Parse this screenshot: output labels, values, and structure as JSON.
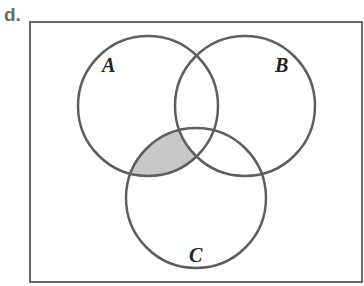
{
  "part_label": "d.",
  "diagram": {
    "type": "venn",
    "universe": {
      "x": 30,
      "y": 22,
      "width": 332,
      "height": 260
    },
    "sets": [
      {
        "id": "A",
        "label": "A",
        "cx": 148,
        "cy": 106,
        "r": 70,
        "label_x": 102,
        "label_y": 72
      },
      {
        "id": "B",
        "label": "B",
        "cx": 245,
        "cy": 106,
        "r": 70,
        "label_x": 275,
        "label_y": 72
      },
      {
        "id": "C",
        "label": "C",
        "cx": 196,
        "cy": 198,
        "r": 70,
        "label_x": 189,
        "label_y": 262
      }
    ],
    "shaded_region": "A ∩ C ∩ B'",
    "colors": {
      "stroke": "#5e5e5e",
      "shade": "#c8c8c8",
      "frame": "#555555"
    }
  }
}
